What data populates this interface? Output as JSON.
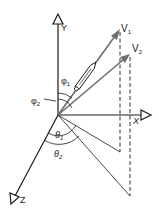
{
  "diagram": {
    "type": "3d-vector-angles",
    "axes": {
      "x_label": "X",
      "y_label": "Y",
      "z_label": "Z"
    },
    "vectors": [
      {
        "name": "V",
        "subscript": "1",
        "color": "#6e6e6e"
      },
      {
        "name": "V",
        "subscript": "2",
        "color": "#6e6e6e"
      }
    ],
    "angles": {
      "phi1": {
        "symbol": "φ",
        "subscript": "1"
      },
      "phi2": {
        "symbol": "φ",
        "subscript": "2"
      },
      "theta1": {
        "symbol": "θ",
        "subscript": "1"
      },
      "theta2": {
        "symbol": "θ",
        "subscript": "2"
      }
    },
    "colors": {
      "axis": "#1a1a1a",
      "vector": "#6e6e6e",
      "background": "#ffffff"
    }
  }
}
